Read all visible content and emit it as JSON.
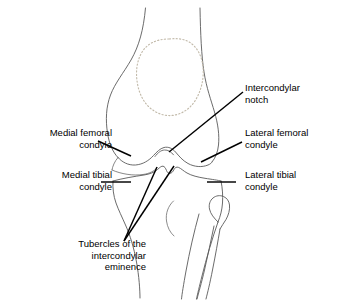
{
  "figure": {
    "type": "anatomical-line-diagram",
    "background_color": "#ffffff",
    "bone_outline_color": "#555555",
    "patella_outline_color": "#c0b8a8",
    "leader_line_color": "#000000",
    "text_color": "#000000",
    "structures": [
      "femur",
      "patella",
      "medial femoral condyle",
      "lateral femoral condyle",
      "intercondylar notch",
      "medial tibial condyle",
      "lateral tibial condyle",
      "tubercles of the intercondylar eminence",
      "tibia",
      "fibula"
    ]
  },
  "labels": {
    "intercondylar_notch": "Intercondylar\nnotch",
    "medial_femoral_condyle": "Medial femoral\ncondyle",
    "lateral_femoral_condyle": "Lateral femoral\ncondyle",
    "medial_tibial_condyle": "Medial tibial\ncondyle",
    "lateral_tibial_condyle": "Lateral tibial\ncondyle",
    "tubercles": "Tubercles of the\nintercondylar\neminence"
  }
}
